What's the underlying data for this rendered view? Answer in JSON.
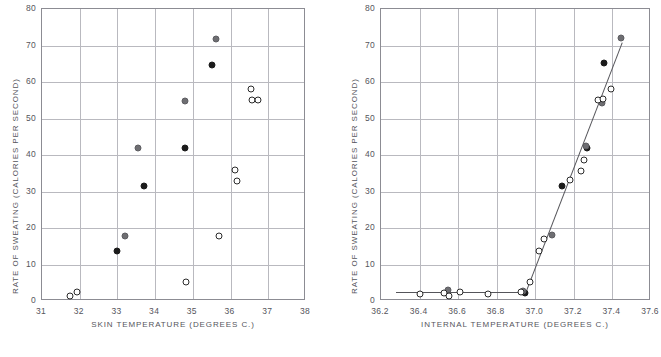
{
  "figure": {
    "panels": [
      "left",
      "right"
    ],
    "caption_fragment": ""
  },
  "chart_data": [
    {
      "type": "scatter",
      "panel": "left",
      "title": "",
      "xlabel": "SKIN TEMPERATURE   (DEGREES C.)",
      "ylabel": "RATE OF SWEATING   (CALORIES PER SECOND)",
      "xlim": [
        31,
        38
      ],
      "ylim": [
        0,
        80
      ],
      "xticks": [
        31,
        32,
        33,
        34,
        35,
        36,
        37,
        38
      ],
      "xtick_labels": [
        "31",
        "32",
        "33",
        "34",
        "35",
        "36",
        "37",
        "38"
      ],
      "yticks": [
        0,
        10,
        20,
        30,
        40,
        50,
        60,
        70,
        80
      ],
      "ytick_labels": [
        "0",
        "10",
        "20",
        "30",
        "40",
        "50",
        "60",
        "70",
        "80"
      ],
      "grid": true,
      "legend": "none",
      "fit_line": null,
      "series": [
        {
          "name": "filled-black",
          "marker": "filled circle (black)",
          "points": [
            {
              "x": 33.0,
              "y": 13.8
            },
            {
              "x": 33.7,
              "y": 31.4
            },
            {
              "x": 34.8,
              "y": 42.0
            },
            {
              "x": 35.5,
              "y": 64.6
            }
          ]
        },
        {
          "name": "filled-gray",
          "marker": "filled circle (gray)",
          "points": [
            {
              "x": 33.2,
              "y": 17.8
            },
            {
              "x": 33.55,
              "y": 42.0
            },
            {
              "x": 34.8,
              "y": 54.7
            },
            {
              "x": 35.62,
              "y": 71.9
            }
          ]
        },
        {
          "name": "open",
          "marker": "open circle",
          "points": [
            {
              "x": 31.75,
              "y": 1.5
            },
            {
              "x": 31.92,
              "y": 2.4
            },
            {
              "x": 34.82,
              "y": 5.2
            },
            {
              "x": 35.7,
              "y": 17.7
            },
            {
              "x": 36.18,
              "y": 33.0
            },
            {
              "x": 36.12,
              "y": 36.0
            },
            {
              "x": 36.55,
              "y": 58.0
            },
            {
              "x": 36.58,
              "y": 55.1
            },
            {
              "x": 36.74,
              "y": 55.0
            }
          ]
        }
      ]
    },
    {
      "type": "scatter",
      "panel": "right",
      "title": "",
      "xlabel": "INTERNAL TEMPERATURE   (DEGREES C.)",
      "ylabel": "RATE OF SWEATING   (CALORIES PER SECOND)",
      "xlim": [
        36.2,
        37.6
      ],
      "ylim": [
        0,
        80
      ],
      "xticks": [
        36.2,
        36.4,
        36.6,
        36.8,
        37.0,
        37.2,
        37.4,
        37.6
      ],
      "xtick_labels": [
        "36.2",
        "36.4",
        "36.6",
        "36.8",
        "37.0",
        "37.2",
        "37.4",
        "37.6"
      ],
      "yticks": [
        0,
        10,
        20,
        30,
        40,
        50,
        60,
        70,
        80
      ],
      "ytick_labels": [
        "0",
        "10",
        "20",
        "30",
        "40",
        "50",
        "60",
        "70",
        "80"
      ],
      "grid": true,
      "legend": "none",
      "fit_line": {
        "name": "two-segment fitted curve",
        "points": [
          {
            "x": 36.28,
            "y": 2.5
          },
          {
            "x": 36.95,
            "y": 2.5
          },
          {
            "x": 37.45,
            "y": 71.0
          }
        ]
      },
      "series": [
        {
          "name": "filled-black",
          "marker": "filled circle (black)",
          "points": [
            {
              "x": 36.945,
              "y": 2.1
            },
            {
              "x": 37.14,
              "y": 31.5
            },
            {
              "x": 37.27,
              "y": 41.9
            },
            {
              "x": 37.355,
              "y": 65.2
            }
          ]
        },
        {
          "name": "filled-gray",
          "marker": "filled circle (gray)",
          "points": [
            {
              "x": 36.545,
              "y": 3.0
            },
            {
              "x": 36.935,
              "y": 2.8
            },
            {
              "x": 37.085,
              "y": 18.0
            },
            {
              "x": 37.265,
              "y": 42.4
            },
            {
              "x": 37.345,
              "y": 54.3
            },
            {
              "x": 37.445,
              "y": 72.0
            }
          ]
        },
        {
          "name": "open",
          "marker": "open circle",
          "points": [
            {
              "x": 36.4,
              "y": 1.8
            },
            {
              "x": 36.525,
              "y": 2.2
            },
            {
              "x": 36.555,
              "y": 1.4
            },
            {
              "x": 36.61,
              "y": 2.5
            },
            {
              "x": 36.755,
              "y": 1.8
            },
            {
              "x": 36.925,
              "y": 2.5
            },
            {
              "x": 36.97,
              "y": 5.2
            },
            {
              "x": 37.02,
              "y": 13.7
            },
            {
              "x": 37.045,
              "y": 17.1
            },
            {
              "x": 37.18,
              "y": 33.1
            },
            {
              "x": 37.235,
              "y": 35.6
            },
            {
              "x": 37.255,
              "y": 38.7
            },
            {
              "x": 37.325,
              "y": 55.2
            },
            {
              "x": 37.35,
              "y": 55.4
            },
            {
              "x": 37.39,
              "y": 58.2
            }
          ]
        }
      ]
    }
  ]
}
